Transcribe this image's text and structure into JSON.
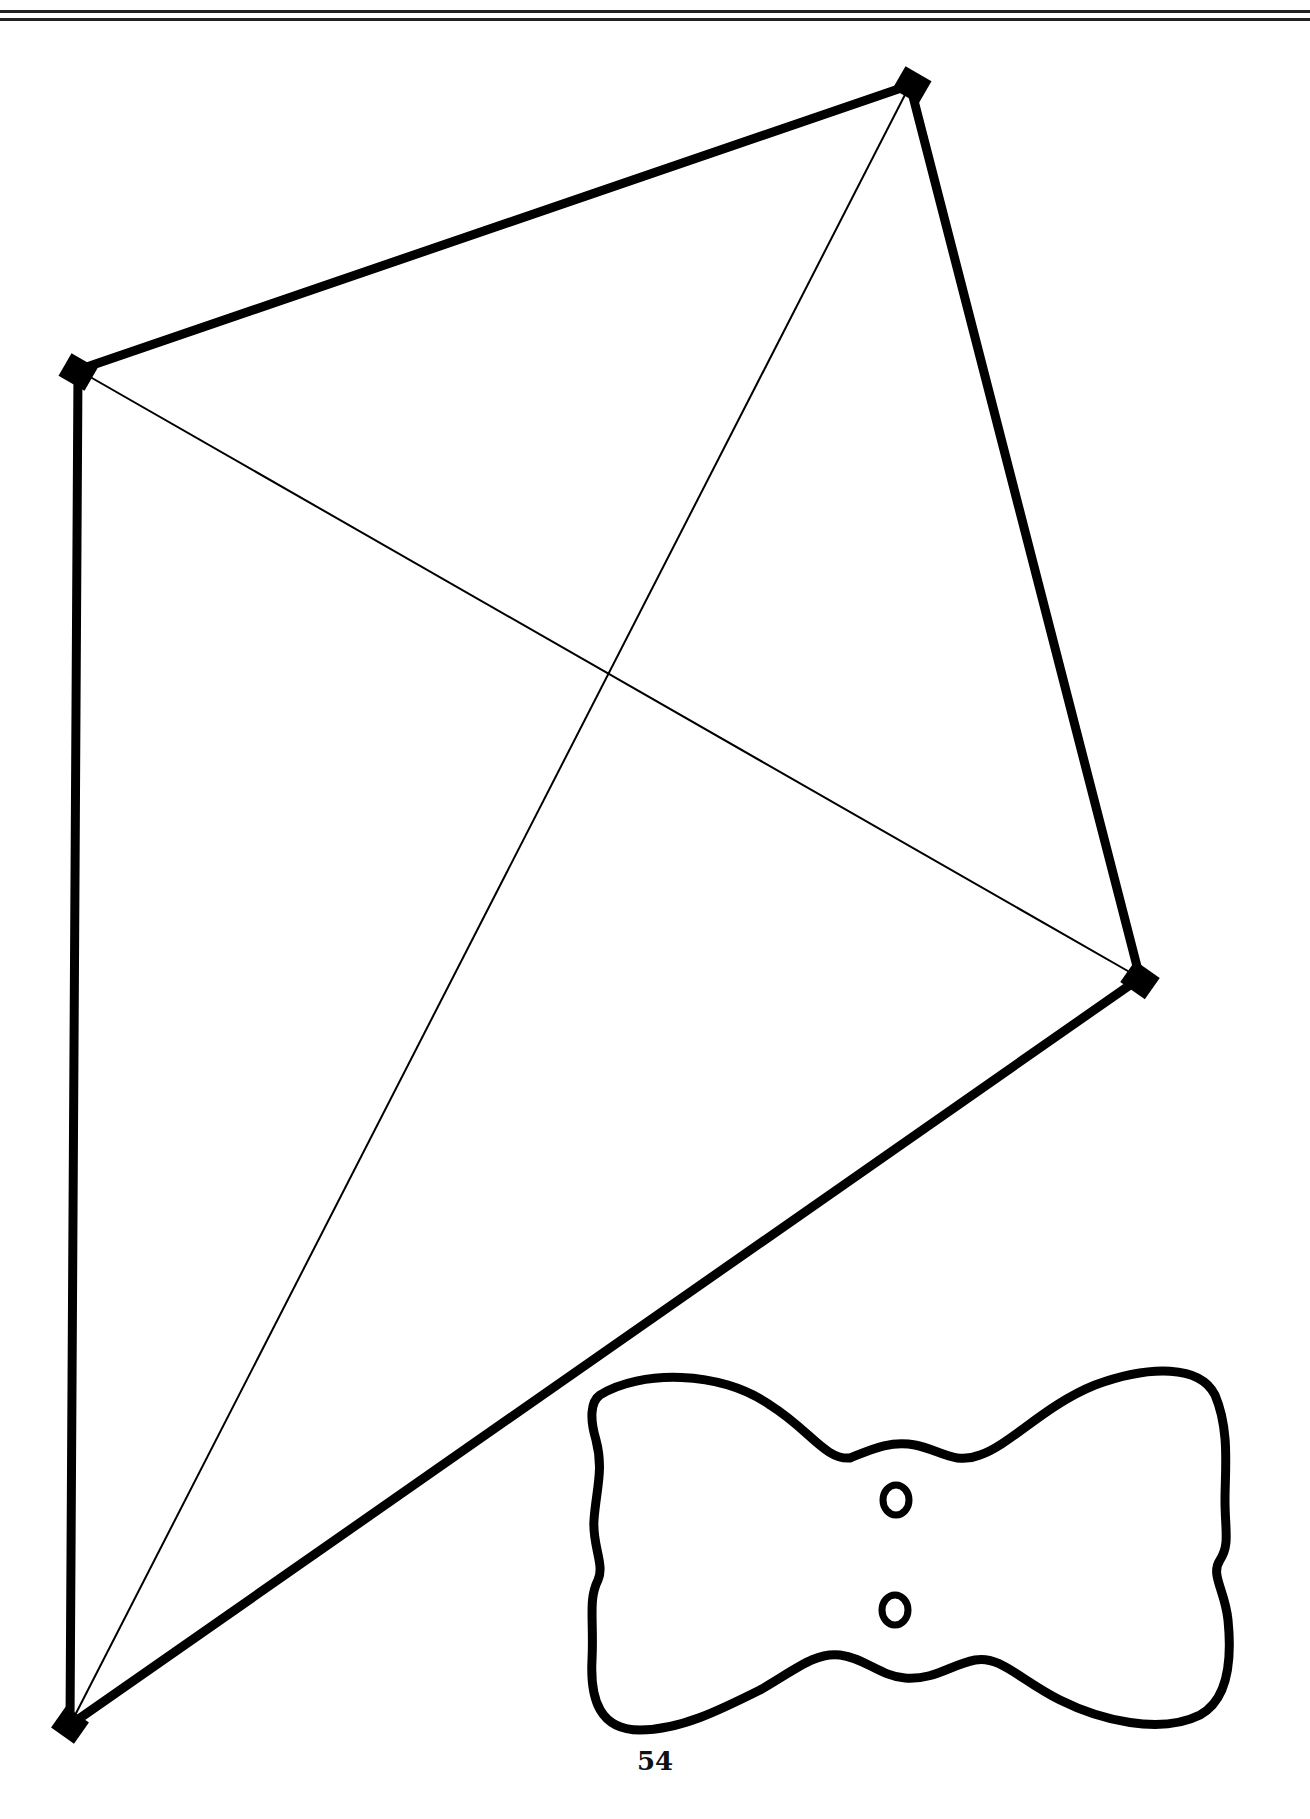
{
  "page": {
    "page_number": "54",
    "header_rules": 2
  },
  "kite": {
    "vertices": {
      "top": [
        910,
        85
      ],
      "left": [
        78,
        370
      ],
      "right": [
        1140,
        978
      ],
      "bottom": [
        70,
        1725
      ]
    },
    "outline_color": "#000000",
    "crossbar_color": "#000000"
  },
  "bow": {
    "holes": 2,
    "outline_color": "#000000"
  }
}
